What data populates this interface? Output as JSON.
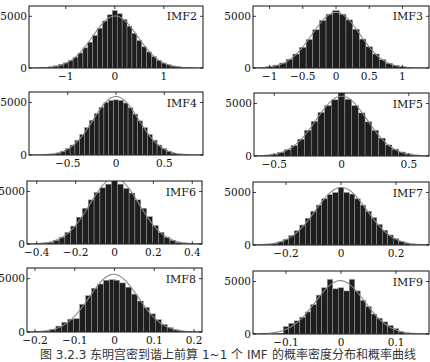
{
  "figure": {
    "caption": "图 3.2.3  东明宫密到谐上前算 1~1 个 IMF 的概率密度分布和概率曲线"
  },
  "chart_data": [
    {
      "type": "bar",
      "title": "IMF2",
      "xlabel": "",
      "ylabel": "",
      "xlim": [
        -1.75,
        1.8
      ],
      "ylim": [
        0,
        6000
      ],
      "xticks": [
        -1,
        0,
        1
      ],
      "xticklabels": [
        "−1",
        "0",
        "1"
      ],
      "yticks": [
        0,
        5000
      ],
      "yticklabels": [
        "0",
        "5000"
      ],
      "bin_centers": [
        -1.5,
        -1.4,
        -1.3,
        -1.2,
        -1.1,
        -1.0,
        -0.9,
        -0.8,
        -0.7,
        -0.6,
        -0.5,
        -0.4,
        -0.3,
        -0.2,
        -0.1,
        0,
        0.1,
        0.2,
        0.3,
        0.4,
        0.5,
        0.6,
        0.7,
        0.8,
        0.9,
        1.0,
        1.1,
        1.2,
        1.3,
        1.4,
        1.5
      ],
      "values": [
        30,
        60,
        110,
        220,
        350,
        500,
        750,
        1050,
        1450,
        1950,
        2500,
        3150,
        3850,
        4550,
        5150,
        5550,
        5250,
        4700,
        4050,
        3350,
        2650,
        2050,
        1550,
        1100,
        750,
        480,
        320,
        200,
        120,
        70,
        30
      ],
      "fit_curve": "gaussian",
      "legend": []
    },
    {
      "type": "bar",
      "title": "IMF3",
      "xlabel": "",
      "ylabel": "",
      "xlim": [
        -1.25,
        1.4
      ],
      "ylim": [
        0,
        6000
      ],
      "xticks": [
        -1,
        -0.5,
        0,
        0.5,
        1
      ],
      "xticklabels": [
        "−1",
        "−0.5",
        "0",
        "0.5",
        "1"
      ],
      "yticks": [
        0,
        5000
      ],
      "yticklabels": [
        "0",
        "5000"
      ],
      "bin_centers": [
        -1.1,
        -1.0,
        -0.9,
        -0.8,
        -0.7,
        -0.6,
        -0.5,
        -0.4,
        -0.3,
        -0.2,
        -0.1,
        0,
        0.1,
        0.2,
        0.3,
        0.4,
        0.5,
        0.6,
        0.7,
        0.8,
        0.9,
        1.0,
        1.1
      ],
      "values": [
        50,
        130,
        280,
        480,
        850,
        1350,
        2000,
        2750,
        3700,
        4600,
        5200,
        5550,
        5200,
        4650,
        3750,
        2800,
        2050,
        1350,
        800,
        450,
        250,
        120,
        50
      ],
      "fit_curve": "gaussian",
      "legend": []
    },
    {
      "type": "bar",
      "title": "IMF4",
      "xlabel": "",
      "ylabel": "",
      "xlim": [
        -0.9,
        0.9
      ],
      "ylim": [
        0,
        6000
      ],
      "xticks": [
        -0.5,
        0,
        0.5
      ],
      "xticklabels": [
        "−0.5",
        "0",
        "0.5"
      ],
      "yticks": [
        0,
        5000
      ],
      "yticklabels": [
        "0",
        "5000"
      ],
      "bin_centers": [
        -0.7,
        -0.65,
        -0.6,
        -0.55,
        -0.5,
        -0.45,
        -0.4,
        -0.35,
        -0.3,
        -0.25,
        -0.2,
        -0.15,
        -0.1,
        -0.05,
        0,
        0.05,
        0.1,
        0.15,
        0.2,
        0.25,
        0.3,
        0.35,
        0.4,
        0.45,
        0.5,
        0.55,
        0.6,
        0.65,
        0.7
      ],
      "values": [
        30,
        80,
        180,
        350,
        600,
        950,
        1400,
        1950,
        2600,
        3300,
        3950,
        4550,
        5000,
        5200,
        5250,
        5200,
        4950,
        4500,
        3900,
        3250,
        2600,
        1950,
        1400,
        950,
        600,
        350,
        180,
        80,
        30
      ],
      "fit_curve": "gaussian",
      "legend": []
    },
    {
      "type": "bar",
      "title": "IMF5",
      "xlabel": "",
      "ylabel": "",
      "xlim": [
        -0.65,
        0.65
      ],
      "ylim": [
        0,
        6000
      ],
      "xticks": [
        -0.5,
        0,
        0.5
      ],
      "xticklabels": [
        "−0.5",
        "0",
        "0.5"
      ],
      "yticks": [
        0,
        5000
      ],
      "yticklabels": [
        "0",
        "5000"
      ],
      "bin_centers": [
        -0.55,
        -0.5,
        -0.45,
        -0.4,
        -0.35,
        -0.3,
        -0.25,
        -0.2,
        -0.15,
        -0.1,
        -0.05,
        0,
        0.05,
        0.1,
        0.15,
        0.2,
        0.25,
        0.3,
        0.35,
        0.4,
        0.45,
        0.5,
        0.55
      ],
      "values": [
        80,
        180,
        350,
        600,
        1000,
        1600,
        2450,
        3300,
        4150,
        4800,
        5350,
        6000,
        5400,
        4800,
        4100,
        3250,
        2450,
        1700,
        1050,
        650,
        380,
        200,
        80
      ],
      "fit_curve": "gaussian",
      "legend": []
    },
    {
      "type": "bar",
      "title": "IMF6",
      "xlabel": "",
      "ylabel": "",
      "xlim": [
        -0.45,
        0.45
      ],
      "ylim": [
        0,
        6000
      ],
      "xticks": [
        -0.4,
        -0.2,
        0,
        0.2,
        0.4
      ],
      "xticklabels": [
        "−0.4",
        "−0.2",
        "0",
        "0.2",
        "0.4"
      ],
      "yticks": [
        0,
        5000
      ],
      "yticklabels": [
        "0",
        "5000"
      ],
      "bin_centers": [
        -0.36,
        -0.33,
        -0.3,
        -0.27,
        -0.24,
        -0.21,
        -0.18,
        -0.15,
        -0.12,
        -0.09,
        -0.06,
        -0.03,
        0,
        0.03,
        0.06,
        0.09,
        0.12,
        0.15,
        0.18,
        0.21,
        0.24,
        0.27,
        0.3,
        0.33,
        0.36
      ],
      "values": [
        60,
        150,
        350,
        650,
        1100,
        1700,
        2550,
        3400,
        4200,
        4900,
        5350,
        5700,
        6000,
        5700,
        5300,
        4850,
        4200,
        3400,
        2600,
        1750,
        1100,
        650,
        350,
        150,
        60
      ],
      "fit_curve": "gaussian",
      "legend": []
    },
    {
      "type": "bar",
      "title": "IMF7",
      "xlabel": "",
      "ylabel": "",
      "xlim": [
        -0.32,
        0.32
      ],
      "ylim": [
        0,
        6000
      ],
      "xticks": [
        -0.2,
        0,
        0.2
      ],
      "xticklabels": [
        "−0.2",
        "0",
        "0.2"
      ],
      "yticks": [
        0,
        5000
      ],
      "yticklabels": [
        "0",
        "5000"
      ],
      "bin_centers": [
        -0.26,
        -0.24,
        -0.22,
        -0.2,
        -0.18,
        -0.16,
        -0.14,
        -0.12,
        -0.1,
        -0.08,
        -0.06,
        -0.04,
        -0.02,
        0,
        0.02,
        0.04,
        0.06,
        0.08,
        0.1,
        0.12,
        0.14,
        0.16,
        0.18,
        0.2,
        0.22,
        0.24,
        0.26
      ],
      "values": [
        60,
        150,
        300,
        550,
        900,
        1350,
        1900,
        2550,
        3200,
        3800,
        4400,
        4800,
        5000,
        5450,
        5000,
        4850,
        4400,
        3800,
        3200,
        2600,
        1950,
        1400,
        950,
        600,
        350,
        180,
        70
      ],
      "fit_curve": "gaussian",
      "legend": []
    },
    {
      "type": "bar",
      "title": "IMF8",
      "xlabel": "",
      "ylabel": "",
      "xlim": [
        -0.22,
        0.22
      ],
      "ylim": [
        0,
        6000
      ],
      "xticks": [
        -0.2,
        -0.1,
        0,
        0.1,
        0.2
      ],
      "xticklabels": [
        "−0.2",
        "−0.1",
        "0",
        "0.1",
        "0.2"
      ],
      "yticks": [
        0,
        5000
      ],
      "yticklabels": [
        "0",
        "5000"
      ],
      "bin_centers": [
        -0.17,
        -0.155,
        -0.14,
        -0.125,
        -0.11,
        -0.095,
        -0.08,
        -0.065,
        -0.05,
        -0.035,
        -0.02,
        -0.005,
        0.005,
        0.02,
        0.035,
        0.05,
        0.065,
        0.08,
        0.095,
        0.11,
        0.125,
        0.14,
        0.155,
        0.17
      ],
      "values": [
        80,
        250,
        550,
        900,
        1200,
        1250,
        2600,
        3400,
        4100,
        4500,
        4850,
        4900,
        4850,
        4600,
        4200,
        3550,
        2900,
        2300,
        1700,
        1150,
        700,
        400,
        200,
        80
      ],
      "fit_curve": "gaussian",
      "legend": []
    },
    {
      "type": "bar",
      "title": "IMF9",
      "xlabel": "",
      "ylabel": "",
      "xlim": [
        -0.16,
        0.16
      ],
      "ylim": [
        0,
        6000
      ],
      "xticks": [
        -0.1,
        0,
        0.1
      ],
      "xticklabels": [
        "−0.1",
        "0",
        "0.1"
      ],
      "yticks": [
        0,
        5000
      ],
      "yticklabels": [
        "0",
        "5000"
      ],
      "bin_centers": [
        -0.12,
        -0.11,
        -0.1,
        -0.09,
        -0.08,
        -0.07,
        -0.06,
        -0.05,
        -0.04,
        -0.03,
        -0.02,
        -0.01,
        0,
        0.01,
        0.02,
        0.03,
        0.04,
        0.05,
        0.06,
        0.07,
        0.08,
        0.09,
        0.1,
        0.11,
        0.12
      ],
      "values": [
        30,
        80,
        700,
        1000,
        1250,
        1600,
        2100,
        2800,
        3700,
        4400,
        5200,
        4300,
        4400,
        4100,
        5200,
        4100,
        3200,
        2600,
        1900,
        1500,
        1150,
        800,
        500,
        200,
        60
      ],
      "fit_curve": "gaussian",
      "legend": []
    }
  ],
  "layout": {
    "panels": [
      {
        "x": 29,
        "y": 6,
        "w": 174,
        "h": 62
      },
      {
        "x": 253,
        "y": 6,
        "w": 176,
        "h": 62
      },
      {
        "x": 29,
        "y": 92,
        "w": 174,
        "h": 63
      },
      {
        "x": 254,
        "y": 93,
        "w": 175,
        "h": 63
      },
      {
        "x": 27,
        "y": 181,
        "w": 175,
        "h": 63
      },
      {
        "x": 253,
        "y": 182,
        "w": 176,
        "h": 63
      },
      {
        "x": 27,
        "y": 268,
        "w": 175,
        "h": 64
      },
      {
        "x": 253,
        "y": 271,
        "w": 176,
        "h": 63
      }
    ],
    "bar_color": "#1e1e1e",
    "bar_edge": "#9a9a9a",
    "curve_color": "#8a8a8a",
    "axis_color": "#111111"
  }
}
